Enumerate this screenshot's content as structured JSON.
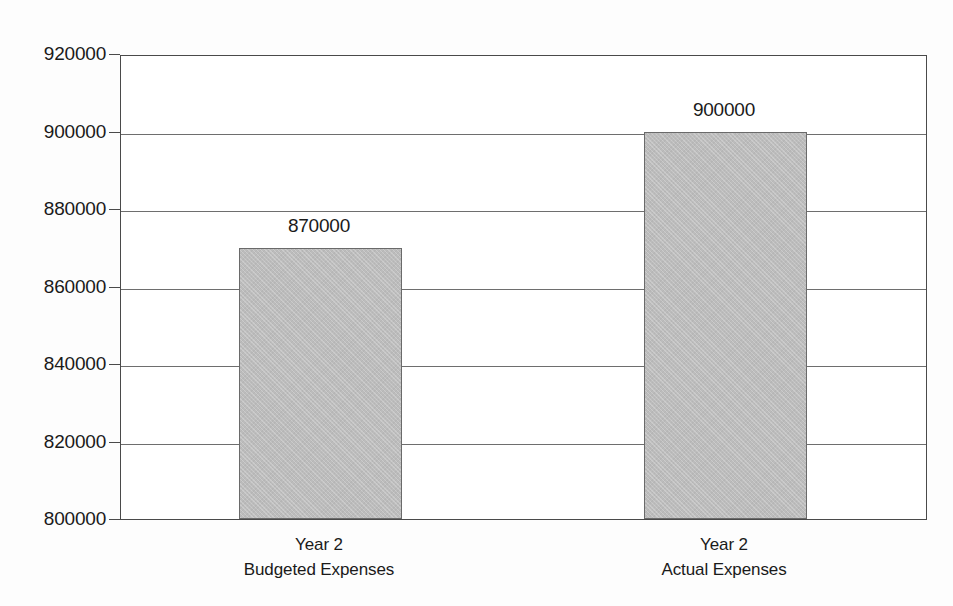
{
  "chart_data": {
    "type": "bar",
    "title": "",
    "subtitle": "",
    "xlabel": "",
    "ylabel": "",
    "categories": [
      "Year 2\nBudgeted Expenses",
      "Year 2\nActual Expenses"
    ],
    "category_lines": [
      [
        "Year 2",
        "Budgeted Expenses"
      ],
      [
        "Year 2",
        "Actual Expenses"
      ]
    ],
    "values": [
      870000,
      900000
    ],
    "value_labels": [
      "870000",
      "900000"
    ],
    "ylim": [
      800000,
      920000
    ],
    "yticks": [
      800000,
      820000,
      840000,
      860000,
      880000,
      900000,
      920000
    ],
    "ytick_labels": [
      "800000",
      "820000",
      "840000",
      "860000",
      "880000",
      "900000",
      "920000"
    ],
    "grid": true,
    "grid_axis": "y",
    "legend": false,
    "legend_position": "none",
    "bar_color": "#bcbcbc",
    "bar_edge_color": "#6a6a6a",
    "axis_color": "#4a4a4a",
    "grid_color": "#6e6e6e",
    "text_color": "#1a1a1a",
    "background_color": "#fdfdfd",
    "plot_background_color": "#ffffff",
    "bars": [
      {
        "index": 0,
        "label_lines": [
          "Year 2",
          "Budgeted Expenses"
        ],
        "value": 870000,
        "value_label": "870000"
      },
      {
        "index": 1,
        "label_lines": [
          "Year 2",
          "Actual Expenses"
        ],
        "value": 900000,
        "value_label": "900000"
      }
    ]
  }
}
